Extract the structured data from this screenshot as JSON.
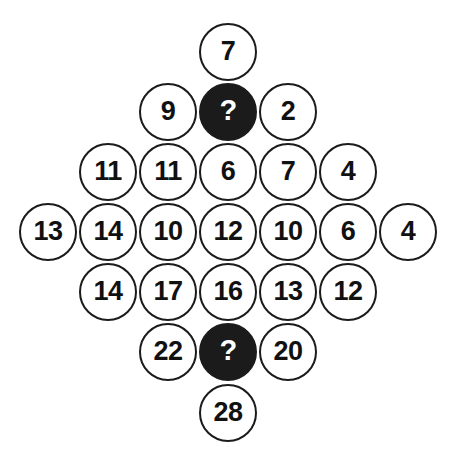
{
  "board": {
    "shape": "diamond",
    "unknown_marker": "?",
    "colors": {
      "background": "#ffffff",
      "circle_outline": "#1b1b1b",
      "circle_fill_known": "#ffffff",
      "circle_fill_unknown": "#1b1b1b",
      "text_known": "#111111",
      "text_unknown": "#ffffff"
    },
    "rows": [
      {
        "index": 0,
        "top": 22,
        "cells": [
          {
            "value": "7",
            "state": "known"
          }
        ]
      },
      {
        "index": 1,
        "top": 82,
        "cells": [
          {
            "value": "9",
            "state": "known"
          },
          {
            "value": "?",
            "state": "unknown"
          },
          {
            "value": "2",
            "state": "known"
          }
        ]
      },
      {
        "index": 2,
        "top": 142,
        "cells": [
          {
            "value": "11",
            "state": "known"
          },
          {
            "value": "11",
            "state": "known"
          },
          {
            "value": "6",
            "state": "known"
          },
          {
            "value": "7",
            "state": "known"
          },
          {
            "value": "4",
            "state": "known"
          }
        ]
      },
      {
        "index": 3,
        "top": 202,
        "cells": [
          {
            "value": "13",
            "state": "known"
          },
          {
            "value": "14",
            "state": "known"
          },
          {
            "value": "10",
            "state": "known"
          },
          {
            "value": "12",
            "state": "known"
          },
          {
            "value": "10",
            "state": "known"
          },
          {
            "value": "6",
            "state": "known"
          },
          {
            "value": "4",
            "state": "known"
          }
        ]
      },
      {
        "index": 4,
        "top": 262,
        "cells": [
          {
            "value": "14",
            "state": "known"
          },
          {
            "value": "17",
            "state": "known"
          },
          {
            "value": "16",
            "state": "known"
          },
          {
            "value": "13",
            "state": "known"
          },
          {
            "value": "12",
            "state": "known"
          }
        ]
      },
      {
        "index": 5,
        "top": 322,
        "cells": [
          {
            "value": "22",
            "state": "known"
          },
          {
            "value": "?",
            "state": "unknown"
          },
          {
            "value": "20",
            "state": "known"
          }
        ]
      },
      {
        "index": 6,
        "top": 383,
        "cells": [
          {
            "value": "28",
            "state": "known"
          }
        ]
      }
    ]
  }
}
